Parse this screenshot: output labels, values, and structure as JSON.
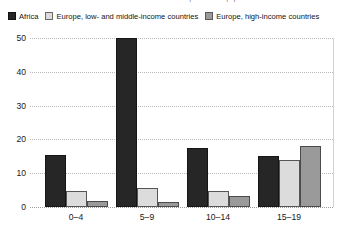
{
  "caption": {
    "clipped_top_line": "Number of deaths from road traffic crashes per 100 000 population"
  },
  "legend": {
    "position": "top-left",
    "items": [
      {
        "label": "Africa",
        "color": "#262626",
        "icon": "legend-swatch"
      },
      {
        "label": "Europe, low- and middle-income countries",
        "color": "#dcdcdc",
        "icon": "legend-swatch"
      },
      {
        "label": "Europe, high-income countries",
        "color": "#9a9a9a",
        "icon": "legend-swatch"
      }
    ]
  },
  "axes": {
    "y_ticks": [
      "0",
      "10",
      "20",
      "30",
      "40",
      "50"
    ],
    "x_ticks": [
      "0–4",
      "5–9",
      "10–14",
      "15–19"
    ]
  },
  "chart_data": {
    "type": "bar",
    "title": "",
    "subtitle": "",
    "xlabel": "",
    "ylabel": "",
    "ylim": [
      0,
      50
    ],
    "grid": true,
    "legend_position": "top-left",
    "categories": [
      "0–4",
      "5–9",
      "10–14",
      "15–19"
    ],
    "series": [
      {
        "name": "Africa",
        "color": "#262626",
        "values": [
          15.4,
          50.0,
          17.6,
          15.2
        ]
      },
      {
        "name": "Europe, low- and middle-income countries",
        "color": "#dcdcdc",
        "values": [
          4.6,
          5.6,
          4.6,
          14.0
        ]
      },
      {
        "name": "Europe, high-income countries",
        "color": "#9a9a9a",
        "values": [
          1.9,
          1.5,
          3.4,
          18.0
        ]
      }
    ]
  }
}
